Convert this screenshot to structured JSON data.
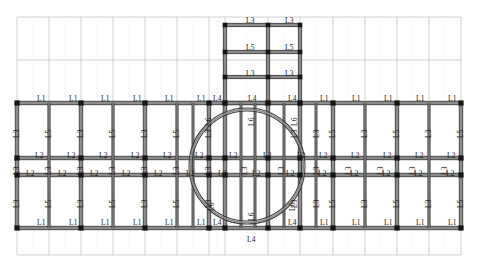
{
  "diagram": {
    "type": "beam-layout-plan",
    "colors": {
      "beam_dark": "#3c3c3c",
      "beam_fill": "#8c8c8c",
      "node": "#141414",
      "grid_light": "#b4b4b4",
      "grid_dashdot": "#c8c8c8",
      "background": "#ffffff",
      "text": "#1a1a1a"
    },
    "beam_types": [
      "L1",
      "L2",
      "L3",
      "L4",
      "L5",
      "L6"
    ],
    "geometry": {
      "main_frame": {
        "x0": 17,
        "x1": 461,
        "y0": 103,
        "y1": 228
      },
      "main_rows_y": [
        103,
        158,
        175,
        228
      ],
      "main_cols_x": [
        17,
        81,
        145,
        209,
        225,
        268,
        300,
        333,
        397,
        461
      ],
      "light_cols_x": [
        49,
        113,
        177,
        365,
        429
      ],
      "tower": {
        "x0": 225,
        "x1": 300,
        "y0": 25,
        "y1": 103,
        "cols_x": [
          225,
          268,
          300
        ],
        "rows_y": [
          25,
          52,
          77,
          103
        ]
      },
      "grid_extent": {
        "x0": 17,
        "x1": 461,
        "y_top": 17,
        "y_bottom": 255
      },
      "grid_rows_y": [
        17,
        60,
        103,
        228,
        255
      ],
      "ring": {
        "cx": 247,
        "cy": 166,
        "r_outer": 58,
        "r_inner": 55
      }
    },
    "labels": {
      "top_row": [
        {
          "text": "L1",
          "x": 37,
          "y": 95
        },
        {
          "text": "L1",
          "x": 69,
          "y": 95
        },
        {
          "text": "L1",
          "x": 101,
          "y": 95
        },
        {
          "text": "L1",
          "x": 133,
          "y": 95
        },
        {
          "text": "L1",
          "x": 165,
          "y": 95
        },
        {
          "text": "L1",
          "x": 197,
          "y": 95
        },
        {
          "text": "L4",
          "x": 213,
          "y": 95
        },
        {
          "text": "L4",
          "x": 248,
          "y": 95
        },
        {
          "text": "L4",
          "x": 288,
          "y": 95
        },
        {
          "text": "L1",
          "x": 320,
          "y": 95
        },
        {
          "text": "L1",
          "x": 352,
          "y": 95
        },
        {
          "text": "L1",
          "x": 384,
          "y": 95
        },
        {
          "text": "L1",
          "x": 416,
          "y": 95
        },
        {
          "text": "L1",
          "x": 448,
          "y": 95
        }
      ],
      "bottom_row": [
        {
          "text": "L1",
          "x": 37,
          "y": 219
        },
        {
          "text": "L1",
          "x": 69,
          "y": 219
        },
        {
          "text": "L1",
          "x": 101,
          "y": 219
        },
        {
          "text": "L1",
          "x": 133,
          "y": 219
        },
        {
          "text": "L1",
          "x": 165,
          "y": 219
        },
        {
          "text": "L1",
          "x": 197,
          "y": 219
        },
        {
          "text": "L4",
          "x": 213,
          "y": 219
        },
        {
          "text": "L4",
          "x": 288,
          "y": 219
        },
        {
          "text": "L1",
          "x": 320,
          "y": 219
        },
        {
          "text": "L1",
          "x": 352,
          "y": 219
        },
        {
          "text": "L1",
          "x": 384,
          "y": 219
        },
        {
          "text": "L1",
          "x": 416,
          "y": 219
        },
        {
          "text": "L1",
          "x": 448,
          "y": 219
        },
        {
          "text": "L4",
          "x": 247,
          "y": 236
        }
      ],
      "mid_upper_L2": [
        {
          "text": "L2",
          "x": 35,
          "y": 152
        },
        {
          "text": "L2",
          "x": 67,
          "y": 152
        },
        {
          "text": "L2",
          "x": 99,
          "y": 152
        },
        {
          "text": "L2",
          "x": 131,
          "y": 152
        },
        {
          "text": "L2",
          "x": 163,
          "y": 152
        },
        {
          "text": "L2",
          "x": 195,
          "y": 152
        },
        {
          "text": "L2",
          "x": 229,
          "y": 152
        },
        {
          "text": "L2",
          "x": 263,
          "y": 152
        },
        {
          "text": "L2",
          "x": 297,
          "y": 152
        },
        {
          "text": "L2",
          "x": 319,
          "y": 152
        },
        {
          "text": "L2",
          "x": 351,
          "y": 152
        },
        {
          "text": "L2",
          "x": 383,
          "y": 152
        },
        {
          "text": "L2",
          "x": 415,
          "y": 152
        },
        {
          "text": "L2",
          "x": 447,
          "y": 152
        }
      ],
      "mid_lower_L2": [
        {
          "text": "L2",
          "x": 26,
          "y": 170
        },
        {
          "text": "L2",
          "x": 58,
          "y": 170
        },
        {
          "text": "L2",
          "x": 90,
          "y": 170
        },
        {
          "text": "L2",
          "x": 122,
          "y": 170
        },
        {
          "text": "L2",
          "x": 154,
          "y": 170
        },
        {
          "text": "L2",
          "x": 186,
          "y": 170
        },
        {
          "text": "L2",
          "x": 218,
          "y": 170
        },
        {
          "text": "L2",
          "x": 252,
          "y": 170
        },
        {
          "text": "L2",
          "x": 286,
          "y": 170
        },
        {
          "text": "L2",
          "x": 318,
          "y": 170
        },
        {
          "text": "L2",
          "x": 350,
          "y": 170
        },
        {
          "text": "L2",
          "x": 382,
          "y": 170
        },
        {
          "text": "L2",
          "x": 414,
          "y": 170
        },
        {
          "text": "L2",
          "x": 446,
          "y": 170
        }
      ],
      "tower_labels": [
        {
          "text": "L3",
          "x": 246,
          "y": 17
        },
        {
          "text": "L3",
          "x": 285,
          "y": 17
        },
        {
          "text": "L5",
          "x": 246,
          "y": 44
        },
        {
          "text": "L5",
          "x": 285,
          "y": 44
        },
        {
          "text": "L3",
          "x": 246,
          "y": 70
        },
        {
          "text": "L3",
          "x": 285,
          "y": 70
        }
      ],
      "vertical_upper": [
        {
          "text": "L3",
          "x": 12,
          "y": 130
        },
        {
          "text": "L5",
          "x": 44,
          "y": 130
        },
        {
          "text": "L3",
          "x": 76,
          "y": 130
        },
        {
          "text": "L5",
          "x": 108,
          "y": 130
        },
        {
          "text": "L3",
          "x": 140,
          "y": 130
        },
        {
          "text": "L5",
          "x": 172,
          "y": 130
        },
        {
          "text": "L3",
          "x": 204,
          "y": 130
        },
        {
          "text": "L6",
          "x": 204,
          "y": 118
        },
        {
          "text": "L6",
          "x": 247,
          "y": 118
        },
        {
          "text": "L3",
          "x": 290,
          "y": 130
        },
        {
          "text": "L6",
          "x": 290,
          "y": 118
        },
        {
          "text": "L3",
          "x": 312,
          "y": 130
        },
        {
          "text": "L5",
          "x": 328,
          "y": 130
        },
        {
          "text": "L3",
          "x": 360,
          "y": 130
        },
        {
          "text": "L5",
          "x": 392,
          "y": 130
        },
        {
          "text": "L3",
          "x": 424,
          "y": 130
        },
        {
          "text": "L5",
          "x": 456,
          "y": 130
        }
      ],
      "vertical_mid": [
        {
          "text": "L3",
          "x": 12,
          "y": 167
        },
        {
          "text": "L3",
          "x": 44,
          "y": 167
        },
        {
          "text": "L3",
          "x": 76,
          "y": 167
        },
        {
          "text": "L3",
          "x": 108,
          "y": 167
        },
        {
          "text": "L3",
          "x": 140,
          "y": 167
        },
        {
          "text": "L3",
          "x": 172,
          "y": 167
        },
        {
          "text": "L3",
          "x": 204,
          "y": 167
        },
        {
          "text": "L3",
          "x": 240,
          "y": 167
        },
        {
          "text": "L3",
          "x": 277,
          "y": 167
        },
        {
          "text": "L3",
          "x": 312,
          "y": 167
        },
        {
          "text": "L3",
          "x": 344,
          "y": 167
        },
        {
          "text": "L3",
          "x": 376,
          "y": 167
        },
        {
          "text": "L3",
          "x": 408,
          "y": 167
        },
        {
          "text": "L3",
          "x": 440,
          "y": 167
        }
      ],
      "vertical_lower": [
        {
          "text": "L3",
          "x": 12,
          "y": 200
        },
        {
          "text": "L5",
          "x": 44,
          "y": 200
        },
        {
          "text": "L3",
          "x": 76,
          "y": 200
        },
        {
          "text": "L5",
          "x": 108,
          "y": 200
        },
        {
          "text": "L3",
          "x": 140,
          "y": 200
        },
        {
          "text": "L5",
          "x": 172,
          "y": 200
        },
        {
          "text": "L3",
          "x": 204,
          "y": 200
        },
        {
          "text": "L6",
          "x": 207,
          "y": 203
        },
        {
          "text": "L6",
          "x": 247,
          "y": 213
        },
        {
          "text": "L3",
          "x": 290,
          "y": 200
        },
        {
          "text": "L6",
          "x": 288,
          "y": 203
        },
        {
          "text": "L3",
          "x": 312,
          "y": 200
        },
        {
          "text": "L5",
          "x": 328,
          "y": 200
        },
        {
          "text": "L3",
          "x": 360,
          "y": 200
        },
        {
          "text": "L5",
          "x": 392,
          "y": 200
        },
        {
          "text": "L3",
          "x": 424,
          "y": 200
        },
        {
          "text": "L5",
          "x": 456,
          "y": 200
        }
      ]
    }
  }
}
